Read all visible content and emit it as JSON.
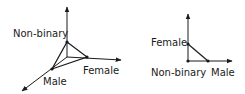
{
  "diagrams": [
    {
      "type": "3d-axes-simplex",
      "labels": {
        "vertical": "Non-binary",
        "horizontal": "Female",
        "diagonal": "Male"
      },
      "points": [
        "Non-binary",
        "Female",
        "Male"
      ]
    },
    {
      "type": "2d-axes-simplex",
      "labels": {
        "vertical": "Female",
        "origin": "Non-binary",
        "horizontal": "Male"
      },
      "points": [
        "Female",
        "Male",
        "Non-binary"
      ]
    }
  ],
  "colors": {
    "line": "#1a1a1a",
    "background": "#ffffff"
  }
}
